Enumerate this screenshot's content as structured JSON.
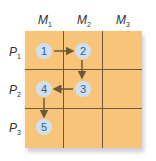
{
  "columns": [
    {
      "letter": "M",
      "sub": "1"
    },
    {
      "letter": "M",
      "sub": "2"
    },
    {
      "letter": "M",
      "sub": "3"
    }
  ],
  "rows": [
    {
      "letter": "P",
      "sub": "1"
    },
    {
      "letter": "P",
      "sub": "2"
    },
    {
      "letter": "P",
      "sub": "3"
    }
  ],
  "nodes": [
    "1",
    "2",
    "3",
    "4",
    "5"
  ],
  "colors": {
    "cell": "#f7c47a",
    "line": "#6e5a3a",
    "node": "#cfe0ee",
    "node_text": "#2f5f9a",
    "arrow": "#6e5a3a"
  }
}
